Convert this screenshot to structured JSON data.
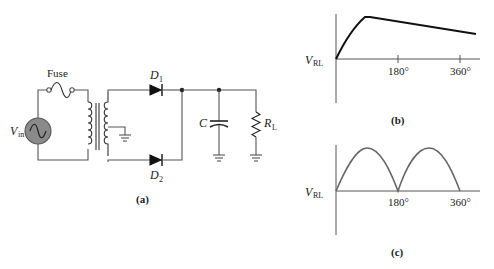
{
  "figure": {
    "panel_a": {
      "caption": "(a)",
      "labels": {
        "fuse": "Fuse",
        "vin_main": "V",
        "vin_sub": "in",
        "d1_main": "D",
        "d1_sub": "1",
        "d2_main": "D",
        "d2_sub": "2",
        "cap": "C",
        "rl_main": "R",
        "rl_sub": "L"
      },
      "components": [
        "ac-source",
        "fuse",
        "center-tapped-transformer",
        "diode-D1",
        "diode-D2",
        "capacitor-C",
        "load-resistor-RL",
        "ground",
        "ground",
        "ground"
      ]
    },
    "panel_b": {
      "caption": "(b)",
      "ylabel_main": "V",
      "ylabel_sub": "RL",
      "ticks": [
        "180°",
        "360°"
      ]
    },
    "panel_c": {
      "caption": "(c)",
      "ylabel_main": "V",
      "ylabel_sub": "RL",
      "ticks": [
        "180°",
        "360°"
      ]
    },
    "colors": {
      "wire": "#555555",
      "source_fill": "#8a8a8a",
      "trace_b": "#111111",
      "trace_c": "#666666"
    }
  }
}
